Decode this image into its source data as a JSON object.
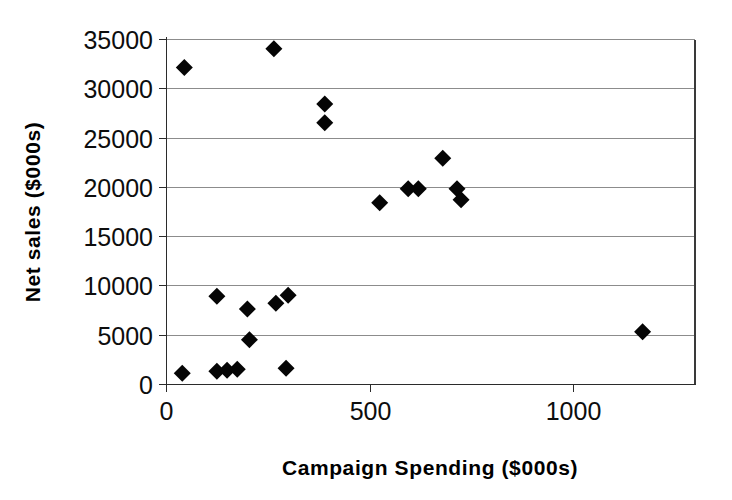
{
  "chart_data": {
    "type": "scatter",
    "title": "",
    "xlabel": "Campaign Spending ($000s)",
    "ylabel": "Net sales ($000s)",
    "xlim": [
      0,
      1300
    ],
    "ylim": [
      0,
      35000
    ],
    "xticks": [
      0,
      500,
      1000
    ],
    "xticklabels": [
      "0",
      "500",
      "1000"
    ],
    "yticks": [
      0,
      5000,
      10000,
      15000,
      20000,
      25000,
      30000,
      35000
    ],
    "yticklabels": [
      "0",
      "5000",
      "10000",
      "15000",
      "20000",
      "25000",
      "30000",
      "35000"
    ],
    "grid": "horizontal",
    "legend": "none",
    "marker": "filled-diamond",
    "marker_color": "#050505",
    "series": [
      {
        "name": "Stores",
        "points": [
          {
            "x": 40,
            "y": 1100
          },
          {
            "x": 45,
            "y": 32100
          },
          {
            "x": 125,
            "y": 1300
          },
          {
            "x": 125,
            "y": 8900
          },
          {
            "x": 150,
            "y": 1400
          },
          {
            "x": 175,
            "y": 1500
          },
          {
            "x": 200,
            "y": 7600
          },
          {
            "x": 205,
            "y": 4500
          },
          {
            "x": 265,
            "y": 34000
          },
          {
            "x": 270,
            "y": 8200
          },
          {
            "x": 295,
            "y": 1600
          },
          {
            "x": 300,
            "y": 9000
          },
          {
            "x": 390,
            "y": 28400
          },
          {
            "x": 390,
            "y": 26500
          },
          {
            "x": 525,
            "y": 18400
          },
          {
            "x": 595,
            "y": 19800
          },
          {
            "x": 620,
            "y": 19800
          },
          {
            "x": 680,
            "y": 22900
          },
          {
            "x": 715,
            "y": 19800
          },
          {
            "x": 725,
            "y": 18700
          },
          {
            "x": 1171,
            "y": 5300
          }
        ]
      }
    ]
  },
  "figure": {
    "background_color": "#ffffff",
    "axis_color": "#2b2b2b",
    "grid_color": "#8c8c8c"
  }
}
